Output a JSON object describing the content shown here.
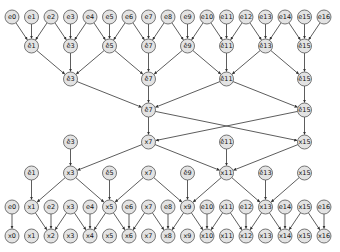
{
  "diagram": {
    "type": "dataflow-network",
    "column_x0": 12,
    "column_step": 19.5,
    "node_radius": 7,
    "colors": {
      "node_fill": "#e3e3e3",
      "node_stroke": "#555555",
      "edge": "#333333"
    },
    "rows_y": [
      17,
      46,
      79,
      110,
      142,
      173,
      207,
      236
    ],
    "nodes": [
      {
        "id": "r0c0",
        "label": "e0",
        "row": 0,
        "col": 0
      },
      {
        "id": "r0c1",
        "label": "e1",
        "row": 0,
        "col": 1
      },
      {
        "id": "r0c2",
        "label": "e2",
        "row": 0,
        "col": 2
      },
      {
        "id": "r0c3",
        "label": "e3",
        "row": 0,
        "col": 3
      },
      {
        "id": "r0c4",
        "label": "e4",
        "row": 0,
        "col": 4
      },
      {
        "id": "r0c5",
        "label": "e5",
        "row": 0,
        "col": 5
      },
      {
        "id": "r0c6",
        "label": "e6",
        "row": 0,
        "col": 6
      },
      {
        "id": "r0c7",
        "label": "e7",
        "row": 0,
        "col": 7
      },
      {
        "id": "r0c8",
        "label": "e8",
        "row": 0,
        "col": 8
      },
      {
        "id": "r0c9",
        "label": "e9",
        "row": 0,
        "col": 9
      },
      {
        "id": "r0c10",
        "label": "e10",
        "row": 0,
        "col": 10
      },
      {
        "id": "r0c11",
        "label": "e11",
        "row": 0,
        "col": 11
      },
      {
        "id": "r0c12",
        "label": "e12",
        "row": 0,
        "col": 12
      },
      {
        "id": "r0c13",
        "label": "e13",
        "row": 0,
        "col": 13
      },
      {
        "id": "r0c14",
        "label": "e14",
        "row": 0,
        "col": 14
      },
      {
        "id": "r0c15",
        "label": "e15",
        "row": 0,
        "col": 15
      },
      {
        "id": "r0c16",
        "label": "e16",
        "row": 0,
        "col": 16
      },
      {
        "id": "r1c1",
        "label": "ê1",
        "row": 1,
        "col": 1
      },
      {
        "id": "r1c3",
        "label": "ê3",
        "row": 1,
        "col": 3
      },
      {
        "id": "r1c5",
        "label": "ê5",
        "row": 1,
        "col": 5
      },
      {
        "id": "r1c7",
        "label": "ê7",
        "row": 1,
        "col": 7
      },
      {
        "id": "r1c9",
        "label": "ê9",
        "row": 1,
        "col": 9
      },
      {
        "id": "r1c11",
        "label": "ê11",
        "row": 1,
        "col": 11
      },
      {
        "id": "r1c13",
        "label": "ê13",
        "row": 1,
        "col": 13
      },
      {
        "id": "r1c15",
        "label": "ê15",
        "row": 1,
        "col": 15
      },
      {
        "id": "r2c3",
        "label": "ê3",
        "row": 2,
        "col": 3
      },
      {
        "id": "r2c7",
        "label": "ê7",
        "row": 2,
        "col": 7
      },
      {
        "id": "r2c11",
        "label": "ê11",
        "row": 2,
        "col": 11
      },
      {
        "id": "r2c15",
        "label": "ê15",
        "row": 2,
        "col": 15
      },
      {
        "id": "r3c7",
        "label": "ê7",
        "row": 3,
        "col": 7
      },
      {
        "id": "r3c15",
        "label": "ê15",
        "row": 3,
        "col": 15
      },
      {
        "id": "r4c3",
        "label": "ê3",
        "row": 4,
        "col": 3
      },
      {
        "id": "r4c7",
        "label": "x7",
        "row": 4,
        "col": 7
      },
      {
        "id": "r4c11",
        "label": "ê11",
        "row": 4,
        "col": 11
      },
      {
        "id": "r4c15",
        "label": "x15",
        "row": 4,
        "col": 15
      },
      {
        "id": "r5c1",
        "label": "ê1",
        "row": 5,
        "col": 1
      },
      {
        "id": "r5c3",
        "label": "x3",
        "row": 5,
        "col": 3
      },
      {
        "id": "r5c5",
        "label": "ê5",
        "row": 5,
        "col": 5
      },
      {
        "id": "r5c7",
        "label": "x7",
        "row": 5,
        "col": 7
      },
      {
        "id": "r5c9",
        "label": "ê9",
        "row": 5,
        "col": 9
      },
      {
        "id": "r5c11",
        "label": "x11",
        "row": 5,
        "col": 11
      },
      {
        "id": "r5c13",
        "label": "ê13",
        "row": 5,
        "col": 13
      },
      {
        "id": "r5c15",
        "label": "x15",
        "row": 5,
        "col": 15
      },
      {
        "id": "r6c0",
        "label": "e0",
        "row": 6,
        "col": 0
      },
      {
        "id": "r6c1",
        "label": "x1",
        "row": 6,
        "col": 1
      },
      {
        "id": "r6c2",
        "label": "e2",
        "row": 6,
        "col": 2
      },
      {
        "id": "r6c3",
        "label": "x3",
        "row": 6,
        "col": 3
      },
      {
        "id": "r6c4",
        "label": "e4",
        "row": 6,
        "col": 4
      },
      {
        "id": "r6c5",
        "label": "x5",
        "row": 6,
        "col": 5
      },
      {
        "id": "r6c6",
        "label": "e6",
        "row": 6,
        "col": 6
      },
      {
        "id": "r6c7",
        "label": "x7",
        "row": 6,
        "col": 7
      },
      {
        "id": "r6c8",
        "label": "e8",
        "row": 6,
        "col": 8
      },
      {
        "id": "r6c9",
        "label": "x9",
        "row": 6,
        "col": 9
      },
      {
        "id": "r6c10",
        "label": "e10",
        "row": 6,
        "col": 10
      },
      {
        "id": "r6c11",
        "label": "x11",
        "row": 6,
        "col": 11
      },
      {
        "id": "r6c12",
        "label": "e12",
        "row": 6,
        "col": 12
      },
      {
        "id": "r6c13",
        "label": "x13",
        "row": 6,
        "col": 13
      },
      {
        "id": "r6c14",
        "label": "e14",
        "row": 6,
        "col": 14
      },
      {
        "id": "r6c15",
        "label": "x15",
        "row": 6,
        "col": 15
      },
      {
        "id": "r6c16",
        "label": "e16",
        "row": 6,
        "col": 16
      },
      {
        "id": "r7c0",
        "label": "x0",
        "row": 7,
        "col": 0
      },
      {
        "id": "r7c1",
        "label": "x1",
        "row": 7,
        "col": 1
      },
      {
        "id": "r7c2",
        "label": "x2",
        "row": 7,
        "col": 2
      },
      {
        "id": "r7c3",
        "label": "x3",
        "row": 7,
        "col": 3
      },
      {
        "id": "r7c4",
        "label": "x4",
        "row": 7,
        "col": 4
      },
      {
        "id": "r7c5",
        "label": "x5",
        "row": 7,
        "col": 5
      },
      {
        "id": "r7c6",
        "label": "x6",
        "row": 7,
        "col": 6
      },
      {
        "id": "r7c7",
        "label": "x7",
        "row": 7,
        "col": 7
      },
      {
        "id": "r7c8",
        "label": "x8",
        "row": 7,
        "col": 8
      },
      {
        "id": "r7c9",
        "label": "x9",
        "row": 7,
        "col": 9
      },
      {
        "id": "r7c10",
        "label": "x10",
        "row": 7,
        "col": 10
      },
      {
        "id": "r7c11",
        "label": "x11",
        "row": 7,
        "col": 11
      },
      {
        "id": "r7c12",
        "label": "x12",
        "row": 7,
        "col": 12
      },
      {
        "id": "r7c13",
        "label": "x13",
        "row": 7,
        "col": 13
      },
      {
        "id": "r7c14",
        "label": "x14",
        "row": 7,
        "col": 14
      },
      {
        "id": "r7c15",
        "label": "x15",
        "row": 7,
        "col": 15
      },
      {
        "id": "r7c16",
        "label": "x16",
        "row": 7,
        "col": 16
      }
    ],
    "edges": [
      [
        "r0c0",
        "r1c1"
      ],
      [
        "r0c1",
        "r1c1"
      ],
      [
        "r0c2",
        "r1c1"
      ],
      [
        "r0c2",
        "r1c3"
      ],
      [
        "r0c3",
        "r1c3"
      ],
      [
        "r0c4",
        "r1c3"
      ],
      [
        "r0c4",
        "r1c5"
      ],
      [
        "r0c5",
        "r1c5"
      ],
      [
        "r0c6",
        "r1c5"
      ],
      [
        "r0c6",
        "r1c7"
      ],
      [
        "r0c7",
        "r1c7"
      ],
      [
        "r0c8",
        "r1c7"
      ],
      [
        "r0c8",
        "r1c9"
      ],
      [
        "r0c9",
        "r1c9"
      ],
      [
        "r0c10",
        "r1c9"
      ],
      [
        "r0c10",
        "r1c11"
      ],
      [
        "r0c11",
        "r1c11"
      ],
      [
        "r0c12",
        "r1c11"
      ],
      [
        "r0c12",
        "r1c13"
      ],
      [
        "r0c13",
        "r1c13"
      ],
      [
        "r0c14",
        "r1c13"
      ],
      [
        "r0c14",
        "r1c15"
      ],
      [
        "r0c15",
        "r1c15"
      ],
      [
        "r0c16",
        "r1c15"
      ],
      [
        "r1c1",
        "r2c3"
      ],
      [
        "r1c3",
        "r2c3"
      ],
      [
        "r1c5",
        "r2c3"
      ],
      [
        "r1c5",
        "r2c7"
      ],
      [
        "r1c7",
        "r2c7"
      ],
      [
        "r1c9",
        "r2c7"
      ],
      [
        "r1c9",
        "r2c11"
      ],
      [
        "r1c11",
        "r2c11"
      ],
      [
        "r1c13",
        "r2c11"
      ],
      [
        "r1c13",
        "r2c15"
      ],
      [
        "r1c15",
        "r2c15"
      ],
      [
        "r2c3",
        "r3c7"
      ],
      [
        "r2c7",
        "r3c7"
      ],
      [
        "r2c11",
        "r3c7"
      ],
      [
        "r2c11",
        "r3c15"
      ],
      [
        "r2c15",
        "r3c15"
      ],
      [
        "r3c7",
        "r4c7"
      ],
      [
        "r3c15",
        "r4c7"
      ],
      [
        "r3c7",
        "r4c15"
      ],
      [
        "r3c15",
        "r4c15"
      ],
      [
        "r4c3",
        "r5c3"
      ],
      [
        "r4c7",
        "r5c3"
      ],
      [
        "r4c7",
        "r5c11"
      ],
      [
        "r4c11",
        "r5c11"
      ],
      [
        "r4c15",
        "r5c11"
      ],
      [
        "r5c1",
        "r6c1"
      ],
      [
        "r5c3",
        "r6c1"
      ],
      [
        "r5c3",
        "r6c5"
      ],
      [
        "r5c5",
        "r6c5"
      ],
      [
        "r5c7",
        "r6c5"
      ],
      [
        "r5c7",
        "r6c9"
      ],
      [
        "r5c9",
        "r6c9"
      ],
      [
        "r5c11",
        "r6c9"
      ],
      [
        "r5c11",
        "r6c13"
      ],
      [
        "r5c13",
        "r6c13"
      ],
      [
        "r5c15",
        "r6c13"
      ],
      [
        "r6c0",
        "r7c0"
      ],
      [
        "r6c1",
        "r7c2"
      ],
      [
        "r6c2",
        "r7c2"
      ],
      [
        "r6c3",
        "r7c2"
      ],
      [
        "r6c3",
        "r7c4"
      ],
      [
        "r6c4",
        "r7c4"
      ],
      [
        "r6c5",
        "r7c4"
      ],
      [
        "r6c5",
        "r7c6"
      ],
      [
        "r6c6",
        "r7c6"
      ],
      [
        "r6c7",
        "r7c6"
      ],
      [
        "r6c7",
        "r7c8"
      ],
      [
        "r6c8",
        "r7c8"
      ],
      [
        "r6c9",
        "r7c8"
      ],
      [
        "r6c9",
        "r7c10"
      ],
      [
        "r6c10",
        "r7c10"
      ],
      [
        "r6c11",
        "r7c10"
      ],
      [
        "r6c11",
        "r7c12"
      ],
      [
        "r6c12",
        "r7c12"
      ],
      [
        "r6c13",
        "r7c12"
      ],
      [
        "r6c13",
        "r7c14"
      ],
      [
        "r6c14",
        "r7c14"
      ],
      [
        "r6c15",
        "r7c14"
      ],
      [
        "r6c15",
        "r7c16"
      ],
      [
        "r6c16",
        "r7c16"
      ]
    ]
  }
}
